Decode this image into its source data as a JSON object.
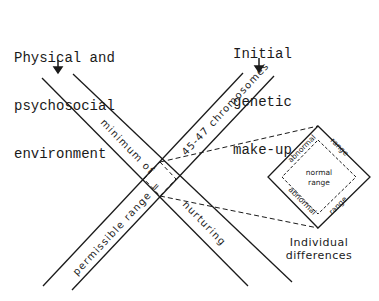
{
  "labels": {
    "environment": [
      "Physical and",
      "psychosocial",
      "environment"
    ],
    "genetic": [
      "Initial",
      "genetic",
      "make-up"
    ],
    "band_left_upper": "minimum of",
    "band_left_lower": "nurturing",
    "band_right_upper": "45-47 chromosomes",
    "band_right_lower": "permissible range =",
    "diamond_outer_top_left": "abnormal",
    "diamond_outer_top_right": "range",
    "diamond_outer_bottom_left": "abnormal",
    "diamond_outer_bottom_right": "range",
    "diamond_inner": [
      "normal",
      "range"
    ],
    "individual": [
      "Individual",
      "differences"
    ]
  },
  "colors": {
    "ink": "#1a1a1a",
    "background": "#ffffff"
  }
}
